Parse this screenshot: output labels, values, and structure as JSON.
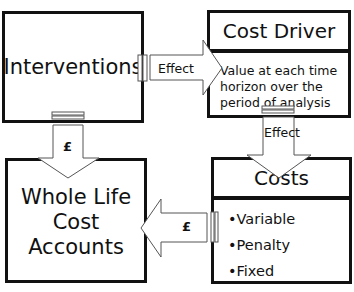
{
  "diagram": {
    "nodes": {
      "interventions": {
        "label": "Interventions"
      },
      "cost_driver": {
        "title": "Cost Driver",
        "description_lines": [
          "Value at each time",
          "horizon over the",
          "period of analysis"
        ]
      },
      "costs": {
        "title": "Costs",
        "items": [
          "•Variable",
          "•Penalty",
          "•Fixed"
        ]
      },
      "whole_life": {
        "label_lines": [
          "Whole Life",
          "Cost",
          "Accounts"
        ]
      }
    },
    "edges": {
      "interventions_to_cost_driver": {
        "label": "Effect"
      },
      "cost_driver_to_costs": {
        "label": "Effect"
      },
      "interventions_to_whole_life": {
        "label": "£"
      },
      "costs_to_whole_life": {
        "label": "£"
      }
    },
    "colors": {
      "border": "#111111",
      "background": "#ffffff",
      "arrow_stroke": "#555555"
    }
  }
}
